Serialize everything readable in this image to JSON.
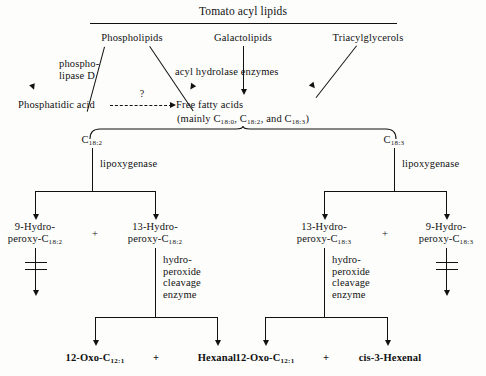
{
  "diagram": {
    "title": "Tomato acyl lipids",
    "lipid_classes": [
      {
        "label": "Phospholipids"
      },
      {
        "label": "Galactolipids"
      },
      {
        "label": "Triacylglycerols"
      }
    ],
    "enzymes_top": {
      "phospholipase": "phospho-\nlipase D",
      "acyl_hydrolase": "acyl hydrolase enzymes"
    },
    "phosphatidic_acid": "Phosphatidic acid",
    "unknown_step": "?",
    "free_fatty_acids": "Free fatty acids",
    "ffa_detail_prefix": "(mainly C",
    "ffa_detail": {
      "prefix": "(mainly C",
      "sub1": "18:0",
      "mid1": ", C",
      "sub2": "18:2",
      "mid2": ", and C",
      "sub3": "18:3",
      "suffix": ")"
    },
    "substrates": [
      {
        "base": "C",
        "sub": "18:2",
        "enzyme": "lipoxygenase"
      },
      {
        "base": "C",
        "sub": "18:3",
        "enzyme": "lipoxygenase"
      }
    ],
    "hydroperoxides": [
      {
        "line1": "9-Hydro-",
        "line2": "peroxy-C",
        "sub": "18:2",
        "blocked": true
      },
      {
        "line1": "13-Hydro-",
        "line2": "peroxy-C",
        "sub": "18:2",
        "blocked": false
      },
      {
        "line1": "13-Hydro-",
        "line2": "peroxy-C",
        "sub": "18:3",
        "blocked": false
      },
      {
        "line1": "9-Hydro-",
        "line2": "peroxy-C",
        "sub": "18:3",
        "blocked": true
      }
    ],
    "plus_signs": [
      "+",
      "+",
      "+",
      "+"
    ],
    "cleavage_enzyme": "hydro-\nperoxide\ncleavage\nenzyme",
    "products_left": {
      "oxo_prefix": "12-Oxo-C",
      "oxo_sub": "12:1",
      "aldehyde": "Hexanal"
    },
    "products_right": {
      "oxo_prefix": "12-Oxo-C",
      "oxo_sub": "12:1",
      "aldehyde_italic": "cis",
      "aldehyde_rest": "-3-Hexenal"
    },
    "colors": {
      "ink": "#111111",
      "paper": "#fdfdfc"
    }
  }
}
